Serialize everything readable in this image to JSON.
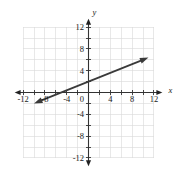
{
  "chart_data": {
    "type": "line",
    "title": "",
    "xlabel": "x",
    "ylabel": "y",
    "xlim": [
      -13,
      13
    ],
    "ylim": [
      -13,
      13
    ],
    "xticks": [
      -12,
      -8,
      -4,
      0,
      4,
      8,
      12
    ],
    "xtick_labels": [
      "-12",
      "-8",
      "-4",
      "0",
      "4",
      "8",
      "12"
    ],
    "yticks": [
      12,
      8,
      4,
      0,
      -4,
      -8,
      -12
    ],
    "ytick_labels": [
      "12",
      "8",
      "4",
      "0",
      "-4",
      "-8",
      "-12"
    ],
    "minor_tick_step": 2,
    "grid": true,
    "grid_step": 2,
    "grid_extent": [
      -12,
      12,
      -12,
      12
    ],
    "legend": null,
    "series": [
      {
        "name": "line",
        "kind": "line-with-arrows",
        "slope": 0.4,
        "intercept": 2,
        "x_intercept": -5,
        "y_intercept": 2,
        "points": [
          [
            -10,
            -2
          ],
          [
            11,
            6.4
          ]
        ],
        "arrow_start": true,
        "arrow_end": true,
        "color": "#3a3a3a"
      }
    ],
    "annotations": []
  },
  "figure": {
    "background_color": "#ffffff",
    "grid_color": "#d8d8d8",
    "axis_color": "#333333",
    "tick_text_color": "#1a1a1a",
    "axis_label_x": "x",
    "axis_label_y": "y"
  }
}
